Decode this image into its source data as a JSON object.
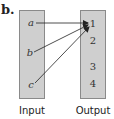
{
  "figure": {
    "label": "b.",
    "input": {
      "caption": "Input",
      "items": [
        "a",
        "b",
        "c"
      ]
    },
    "output": {
      "caption": "Output",
      "items": [
        "1",
        "2",
        "3",
        "4"
      ]
    },
    "mappings": [
      {
        "from": "a",
        "to": "1"
      },
      {
        "from": "b",
        "to": "1"
      },
      {
        "from": "c",
        "to": "1"
      }
    ],
    "colors": {
      "box_fill": "#cfcfcf",
      "box_border": "#8a8a8a",
      "arrow": "#222222"
    }
  }
}
